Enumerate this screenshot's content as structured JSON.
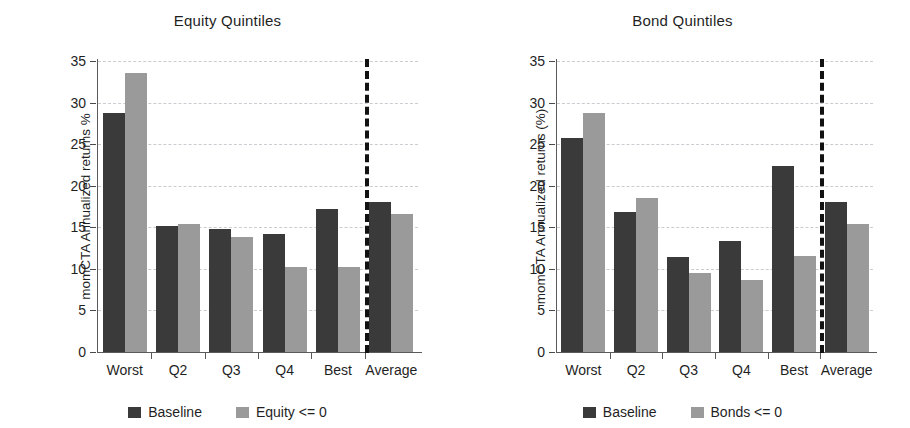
{
  "chart_data": [
    {
      "type": "bar",
      "title": "Equity Quintiles",
      "xlabel": "",
      "ylabel": "momCTA Annualized returns %",
      "categories": [
        "Worst",
        "Q2",
        "Q3",
        "Q4",
        "Best",
        "Average"
      ],
      "series": [
        {
          "name": "Baseline",
          "color": "#3a3a3a",
          "values": [
            28.8,
            15.1,
            14.8,
            14.2,
            17.2,
            18.0
          ]
        },
        {
          "name": "Equity <= 0",
          "color": "#9a9a9a",
          "values": [
            33.5,
            15.4,
            13.8,
            10.2,
            10.2,
            16.6
          ]
        }
      ],
      "ylim": [
        0,
        35
      ],
      "yticks": [
        0,
        5,
        10,
        15,
        20,
        25,
        30,
        35
      ],
      "ytick_labels": [
        "0",
        "5",
        "10",
        "15",
        "20",
        "25",
        "30",
        "35"
      ],
      "grid": true,
      "legend_position": "bottom",
      "separator_after_category": "Best",
      "separator_style": "dashed-vertical-black"
    },
    {
      "type": "bar",
      "title": "Bond Quintiles",
      "xlabel": "",
      "ylabel": "momCTA Annualized returns (%)",
      "categories": [
        "Worst",
        "Q2",
        "Q3",
        "Q4",
        "Best",
        "Average"
      ],
      "series": [
        {
          "name": "Baseline",
          "color": "#3a3a3a",
          "values": [
            25.7,
            16.8,
            11.4,
            13.4,
            22.4,
            18.0
          ]
        },
        {
          "name": "Bonds <= 0",
          "color": "#9a9a9a",
          "values": [
            28.8,
            18.5,
            9.5,
            8.7,
            11.5,
            15.4
          ]
        }
      ],
      "ylim": [
        0,
        35
      ],
      "yticks": [
        0,
        5,
        10,
        15,
        20,
        25,
        30,
        35
      ],
      "ytick_labels": [
        "0",
        "5",
        "10",
        "15",
        "20",
        "25",
        "30",
        "35"
      ],
      "grid": true,
      "legend_position": "bottom",
      "separator_after_category": "Best",
      "separator_style": "dashed-vertical-black"
    }
  ],
  "colors": {
    "series_baseline": "#3a3a3a",
    "series_shock": "#9a9a9a",
    "gridline": "#c9ccd1",
    "axis": "#5a5a5a",
    "separator": "#121212",
    "background": "#ffffff",
    "text": "#1f1f1f"
  }
}
